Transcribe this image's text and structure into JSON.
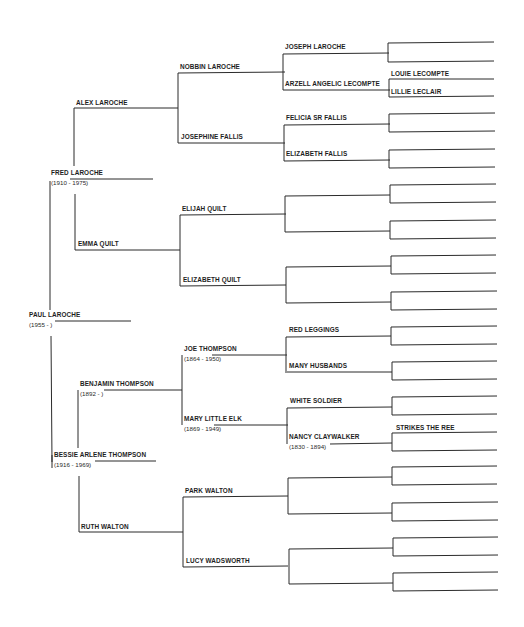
{
  "chart": {
    "type": "pedigree",
    "title": "",
    "line_color": "#2b2b2b",
    "generations": 6
  },
  "people": {
    "g0": {
      "name": "PAUL LAROCHE",
      "dates": "(1955 - )"
    },
    "g1_father": {
      "name": "FRED LAROCHE",
      "dates": "(1910 - 1975)"
    },
    "g1_mother": {
      "name": "BESSIE ARLENE THOMPSON",
      "dates": "(1916 - 1969)"
    },
    "g2_ff": {
      "name": "ALEX LAROCHE",
      "dates": ""
    },
    "g2_fm": {
      "name": "EMMA QUILT",
      "dates": ""
    },
    "g2_mf": {
      "name": "BENJAMIN THOMPSON",
      "dates": "(1892 - )"
    },
    "g2_mm": {
      "name": "RUTH WALTON",
      "dates": ""
    },
    "g3": [
      {
        "name": "NOBBIN LAROCHE",
        "dates": ""
      },
      {
        "name": "JOSEPHINE FALLIS",
        "dates": ""
      },
      {
        "name": "ELIJAH QUILT",
        "dates": ""
      },
      {
        "name": "ELIZABETH QUILT",
        "dates": ""
      },
      {
        "name": "JOE THOMPSON",
        "dates": "(1864 - 1950)"
      },
      {
        "name": "MARY LITTLE ELK",
        "dates": "(1869 - 1949)"
      },
      {
        "name": "PARK WALTON",
        "dates": ""
      },
      {
        "name": "LUCY WADSWORTH",
        "dates": ""
      }
    ],
    "g4": [
      {
        "name": "JOSEPH LAROCHE",
        "dates": ""
      },
      {
        "name": "ARZELL ANGELIC LECOMPTE",
        "dates": ""
      },
      {
        "name": "FELICIA SR FALLIS",
        "dates": ""
      },
      {
        "name": "ELIZABETH FALLIS",
        "dates": ""
      },
      {
        "name": "",
        "dates": ""
      },
      {
        "name": "",
        "dates": ""
      },
      {
        "name": "",
        "dates": ""
      },
      {
        "name": "",
        "dates": ""
      },
      {
        "name": "RED LEGGINGS",
        "dates": ""
      },
      {
        "name": "MANY HUSBANDS",
        "dates": ""
      },
      {
        "name": "WHITE SOLDIER",
        "dates": ""
      },
      {
        "name": "NANCY CLAYWALKER",
        "dates": "(1830 - 1894)"
      },
      {
        "name": "",
        "dates": ""
      },
      {
        "name": "",
        "dates": ""
      },
      {
        "name": "",
        "dates": ""
      },
      {
        "name": "",
        "dates": ""
      }
    ],
    "g5_labels": {
      "louie": "LOUIE LECOMPTE",
      "lillie": "LILLIE LECLAIR",
      "strikes": "STRIKES THE REE"
    }
  }
}
